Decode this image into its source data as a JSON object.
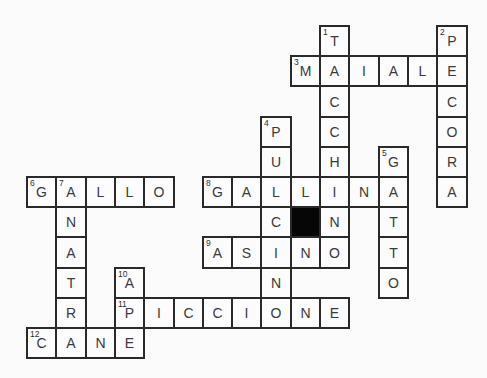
{
  "app": {
    "page_bg": "#fbfbfb"
  },
  "grid": {
    "rows": 11,
    "cols": 15,
    "origin_x": 26,
    "origin_y": 25,
    "pitch_x": 29.3,
    "pitch_y": 30.2,
    "border_px": 2,
    "border_color": "#2a2a2a",
    "cell_bg": "#fcfcfc",
    "block_bg": "#060606",
    "letter_color": "#3a3a3a",
    "number_color": "#2e2e2e"
  },
  "cells": [
    {
      "r": 0,
      "c": 10,
      "letter": "T",
      "num": "1"
    },
    {
      "r": 0,
      "c": 14,
      "letter": "P",
      "num": "2"
    },
    {
      "r": 1,
      "c": 9,
      "letter": "M",
      "num": "3"
    },
    {
      "r": 1,
      "c": 10,
      "letter": "A"
    },
    {
      "r": 1,
      "c": 11,
      "letter": "I"
    },
    {
      "r": 1,
      "c": 12,
      "letter": "A"
    },
    {
      "r": 1,
      "c": 13,
      "letter": "L"
    },
    {
      "r": 1,
      "c": 14,
      "letter": "E"
    },
    {
      "r": 2,
      "c": 10,
      "letter": "C"
    },
    {
      "r": 2,
      "c": 14,
      "letter": "C"
    },
    {
      "r": 3,
      "c": 8,
      "letter": "P",
      "num": "4"
    },
    {
      "r": 3,
      "c": 10,
      "letter": "C"
    },
    {
      "r": 3,
      "c": 14,
      "letter": "O"
    },
    {
      "r": 4,
      "c": 8,
      "letter": "U"
    },
    {
      "r": 4,
      "c": 10,
      "letter": "H"
    },
    {
      "r": 4,
      "c": 12,
      "letter": "G",
      "num": "5"
    },
    {
      "r": 4,
      "c": 14,
      "letter": "R"
    },
    {
      "r": 5,
      "c": 0,
      "letter": "G",
      "num": "6"
    },
    {
      "r": 5,
      "c": 1,
      "letter": "A",
      "num": "7"
    },
    {
      "r": 5,
      "c": 2,
      "letter": "L"
    },
    {
      "r": 5,
      "c": 3,
      "letter": "L"
    },
    {
      "r": 5,
      "c": 4,
      "letter": "O"
    },
    {
      "r": 5,
      "c": 6,
      "letter": "G",
      "num": "8"
    },
    {
      "r": 5,
      "c": 7,
      "letter": "A"
    },
    {
      "r": 5,
      "c": 8,
      "letter": "L"
    },
    {
      "r": 5,
      "c": 9,
      "letter": "L"
    },
    {
      "r": 5,
      "c": 10,
      "letter": "I"
    },
    {
      "r": 5,
      "c": 11,
      "letter": "N"
    },
    {
      "r": 5,
      "c": 12,
      "letter": "A"
    },
    {
      "r": 5,
      "c": 14,
      "letter": "A"
    },
    {
      "r": 6,
      "c": 1,
      "letter": "N"
    },
    {
      "r": 6,
      "c": 8,
      "letter": "C"
    },
    {
      "r": 6,
      "c": 9,
      "block": true
    },
    {
      "r": 6,
      "c": 10,
      "letter": "N"
    },
    {
      "r": 6,
      "c": 12,
      "letter": "T"
    },
    {
      "r": 7,
      "c": 1,
      "letter": "A"
    },
    {
      "r": 7,
      "c": 6,
      "letter": "A",
      "num": "9"
    },
    {
      "r": 7,
      "c": 7,
      "letter": "S"
    },
    {
      "r": 7,
      "c": 8,
      "letter": "I"
    },
    {
      "r": 7,
      "c": 9,
      "letter": "N"
    },
    {
      "r": 7,
      "c": 10,
      "letter": "O"
    },
    {
      "r": 7,
      "c": 12,
      "letter": "T"
    },
    {
      "r": 8,
      "c": 1,
      "letter": "T"
    },
    {
      "r": 8,
      "c": 3,
      "letter": "A",
      "num": "10"
    },
    {
      "r": 8,
      "c": 8,
      "letter": "N"
    },
    {
      "r": 8,
      "c": 12,
      "letter": "O"
    },
    {
      "r": 9,
      "c": 1,
      "letter": "R"
    },
    {
      "r": 9,
      "c": 3,
      "letter": "P",
      "num": "11"
    },
    {
      "r": 9,
      "c": 4,
      "letter": "I"
    },
    {
      "r": 9,
      "c": 5,
      "letter": "C"
    },
    {
      "r": 9,
      "c": 6,
      "letter": "C"
    },
    {
      "r": 9,
      "c": 7,
      "letter": "I"
    },
    {
      "r": 9,
      "c": 8,
      "letter": "O"
    },
    {
      "r": 9,
      "c": 9,
      "letter": "N"
    },
    {
      "r": 9,
      "c": 10,
      "letter": "E"
    },
    {
      "r": 10,
      "c": 0,
      "letter": "C",
      "num": "12"
    },
    {
      "r": 10,
      "c": 1,
      "letter": "A"
    },
    {
      "r": 10,
      "c": 2,
      "letter": "N"
    },
    {
      "r": 10,
      "c": 3,
      "letter": "E"
    }
  ],
  "words": [
    {
      "num": "1",
      "dir": "down",
      "answer": "TACCHINO"
    },
    {
      "num": "2",
      "dir": "down",
      "answer": "PECORA"
    },
    {
      "num": "3",
      "dir": "across",
      "answer": "MAIALE"
    },
    {
      "num": "4",
      "dir": "down",
      "answer": "PULCINO"
    },
    {
      "num": "5",
      "dir": "down",
      "answer": "GATTO"
    },
    {
      "num": "6",
      "dir": "across",
      "answer": "GALLO"
    },
    {
      "num": "7",
      "dir": "down",
      "answer": "ANATRA"
    },
    {
      "num": "8",
      "dir": "across",
      "answer": "GALLINA"
    },
    {
      "num": "9",
      "dir": "across",
      "answer": "ASINO"
    },
    {
      "num": "10",
      "dir": "down",
      "answer": "APE"
    },
    {
      "num": "11",
      "dir": "across",
      "answer": "PICCIONE"
    },
    {
      "num": "12",
      "dir": "across",
      "answer": "CANE"
    }
  ]
}
